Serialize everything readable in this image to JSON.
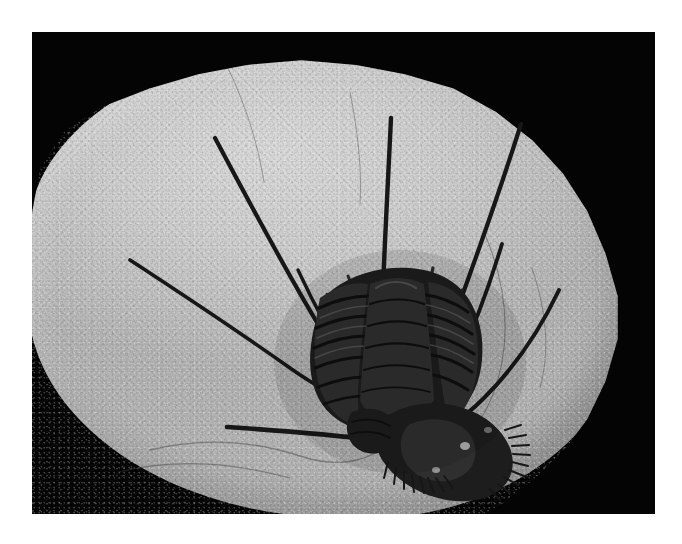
{
  "image": {
    "kind": "photograph",
    "subject": "trilobite-fossil-on-limestone-slab",
    "description": "Black-and-white photograph of a long-spined trilobite fossil preserved on a pale limestone slab against a black background",
    "caption": "",
    "alt_text": "Trilobite fossil with long slender spines on a limestone slab",
    "colors": {
      "page_background": "#ffffff",
      "photo_background": "#040404",
      "slab_light": "#d9d9d9",
      "slab_mid": "#c2c2c2",
      "slab_shadow": "#a6a6a6",
      "fossil_dark": "#171717",
      "fossil_mid": "#2f2f2f"
    },
    "frame": {
      "left": 32,
      "top": 32,
      "width": 623,
      "height": 482
    }
  },
  "subject": {
    "label": "trilobite-fossil",
    "parts": [
      {
        "name": "cephalon",
        "label": "Cephalon (head shield)"
      },
      {
        "name": "thorax",
        "label": "Thorax with articulated segments"
      },
      {
        "name": "axial-lobe",
        "label": "Axial lobe"
      },
      {
        "name": "pleural-spines",
        "label": "Long pleural spines"
      },
      {
        "name": "genal-spine",
        "label": "Genal spine"
      },
      {
        "name": "marginal-fringe",
        "label": "Marginal fringe of short spines"
      },
      {
        "name": "pygidium",
        "label": "Pygidium (tail)"
      }
    ],
    "matrix": {
      "name": "limestone-matrix",
      "label": "Limestone matrix slab"
    }
  }
}
